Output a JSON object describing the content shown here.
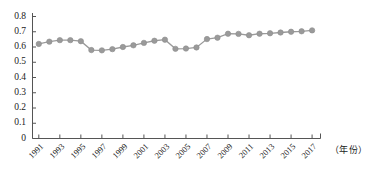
{
  "chart_data": {
    "type": "line",
    "title": "",
    "subtitle": "",
    "xlabel": "（年份）",
    "ylabel": "",
    "xlim": [
      1990.4,
      2017.8
    ],
    "ylim": [
      0,
      0.8
    ],
    "grid": false,
    "legend": null,
    "series_color": "#9a9a9a",
    "marker": "circle",
    "x": [
      1991,
      1992,
      1993,
      1994,
      1995,
      1996,
      1997,
      1998,
      1999,
      2000,
      2001,
      2002,
      2003,
      2004,
      2005,
      2006,
      2007,
      2008,
      2009,
      2010,
      2011,
      2012,
      2013,
      2014,
      2015,
      2016,
      2017
    ],
    "values": [
      0.62,
      0.635,
      0.645,
      0.645,
      0.638,
      0.58,
      0.578,
      0.586,
      0.6,
      0.611,
      0.627,
      0.641,
      0.648,
      0.588,
      0.59,
      0.597,
      0.652,
      0.661,
      0.687,
      0.686,
      0.677,
      0.687,
      0.69,
      0.695,
      0.7,
      0.703,
      0.709
    ],
    "ytick_labels": [
      "0.8",
      "0.7",
      "0.6",
      "0.5",
      "0.4",
      "0.3",
      "0.2",
      "0.1",
      "0"
    ],
    "ytick_values": [
      0.8,
      0.7,
      0.6,
      0.5,
      0.4,
      0.3,
      0.2,
      0.1,
      0
    ],
    "xtick_labels": [
      "1991",
      "1993",
      "1995",
      "1997",
      "1999",
      "2001",
      "2003",
      "2005",
      "2007",
      "2009",
      "2011",
      "2013",
      "2015",
      "2017"
    ],
    "xtick_values": [
      1991,
      1993,
      1995,
      1997,
      1999,
      2001,
      2003,
      2005,
      2007,
      2009,
      2011,
      2013,
      2015,
      2017
    ]
  },
  "axes": {
    "axis_color": "#555555",
    "tick_color": "#555555"
  }
}
